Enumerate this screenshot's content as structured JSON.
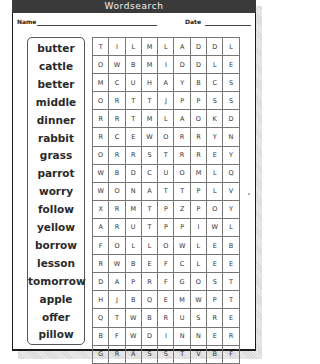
{
  "header": {
    "title": "Wordsearch"
  },
  "form": {
    "name_label": "Name",
    "date_label": "Date"
  },
  "word_list": [
    "butter",
    "cattle",
    "better",
    "middle",
    "dinner",
    "rabbit",
    "grass",
    "parrot",
    "worry",
    "follow",
    "yellow",
    "borrow",
    "lesson",
    "tomorrow",
    "apple",
    "offer",
    "pillow"
  ],
  "grid": [
    [
      "T",
      "I",
      "L",
      "M",
      "L",
      "A",
      "D",
      "D",
      "L"
    ],
    [
      "O",
      "W",
      "B",
      "M",
      "I",
      "D",
      "D",
      "L",
      "E"
    ],
    [
      "M",
      "C",
      "U",
      "H",
      "A",
      "Y",
      "B",
      "C",
      "S"
    ],
    [
      "O",
      "R",
      "T",
      "T",
      "J",
      "P",
      "P",
      "S",
      "S"
    ],
    [
      "R",
      "R",
      "T",
      "M",
      "L",
      "A",
      "O",
      "K",
      "D"
    ],
    [
      "R",
      "C",
      "E",
      "W",
      "O",
      "R",
      "R",
      "Y",
      "N"
    ],
    [
      "O",
      "R",
      "R",
      "S",
      "T",
      "R",
      "R",
      "E",
      "Y"
    ],
    [
      "W",
      "B",
      "D",
      "C",
      "U",
      "O",
      "M",
      "L",
      "Q"
    ],
    [
      "W",
      "O",
      "N",
      "A",
      "T",
      "T",
      "P",
      "L",
      "V"
    ],
    [
      "X",
      "R",
      "M",
      "T",
      "P",
      "Z",
      "P",
      "O",
      "Y"
    ],
    [
      "A",
      "R",
      "U",
      "T",
      "P",
      "P",
      "I",
      "W",
      "L"
    ],
    [
      "F",
      "O",
      "L",
      "L",
      "O",
      "W",
      "L",
      "E",
      "B"
    ],
    [
      "R",
      "W",
      "B",
      "E",
      "F",
      "C",
      "L",
      "E",
      "E"
    ],
    [
      "D",
      "A",
      "P",
      "R",
      "F",
      "G",
      "O",
      "S",
      "T"
    ],
    [
      "H",
      "J",
      "B",
      "Q",
      "E",
      "M",
      "W",
      "P",
      "T"
    ],
    [
      "Q",
      "T",
      "W",
      "B",
      "R",
      "U",
      "S",
      "R",
      "E"
    ],
    [
      "B",
      "F",
      "W",
      "D",
      "I",
      "N",
      "N",
      "E",
      "R"
    ],
    [
      "G",
      "R",
      "A",
      "S",
      "S",
      "T",
      "V",
      "B",
      "F"
    ]
  ]
}
